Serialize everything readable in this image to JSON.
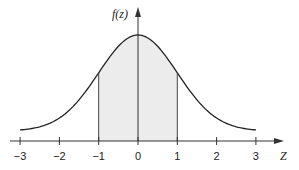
{
  "chart_data": {
    "type": "area",
    "title": "",
    "xlabel": "Z",
    "ylabel": "f(z)",
    "xlim": [
      -3,
      3
    ],
    "x_ticks": [
      -3,
      -2,
      -1,
      0,
      1,
      2,
      3
    ],
    "x_tick_labels": [
      "−3",
      "−2",
      "−1",
      "0",
      "1",
      "2",
      "3"
    ],
    "grid": false,
    "legend": null,
    "series": [
      {
        "name": "standard normal density f(z)",
        "x": [
          -3,
          -2.5,
          -2,
          -1.5,
          -1,
          -0.5,
          0,
          0.5,
          1,
          1.5,
          2,
          2.5,
          3
        ],
        "values": [
          0.0044,
          0.0175,
          0.054,
          0.1295,
          0.242,
          0.3521,
          0.3989,
          0.3521,
          0.242,
          0.1295,
          0.054,
          0.0175,
          0.0044
        ]
      }
    ],
    "shaded_region": {
      "from": -1,
      "to": 1,
      "color": "#ececec"
    },
    "vertical_lines": [
      -1,
      0,
      1
    ],
    "colors": {
      "curve": "#222222",
      "shade": "#ececec",
      "axis": "#333333"
    }
  }
}
